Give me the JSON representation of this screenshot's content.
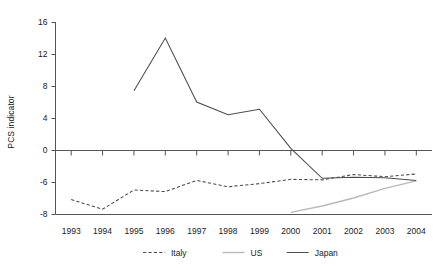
{
  "chart_data": {
    "type": "line",
    "title": "",
    "subtitle": "",
    "xlabel": "",
    "ylabel": "PCS indicator",
    "x": [
      1993,
      1994,
      1995,
      1996,
      1997,
      1998,
      1999,
      2000,
      2001,
      2002,
      2003,
      2004
    ],
    "xtick_labels": [
      "1993",
      "1994",
      "1995",
      "1996",
      "1997",
      "1998",
      "1999",
      "2000",
      "2001",
      "2002",
      "2003",
      "2004"
    ],
    "ytick_labels": [
      "16",
      "12",
      "8",
      "4",
      "0",
      "-6",
      "-8"
    ],
    "ytick_values": [
      16,
      12,
      8,
      4,
      0,
      -6,
      -8
    ],
    "ylim": [
      -8,
      16
    ],
    "grid": false,
    "legend_position": "bottom",
    "zero_line": true,
    "series": [
      {
        "name": "Italy",
        "style": "dashed",
        "color": "#4a4a4a",
        "x": [
          1993,
          1994,
          1995,
          1996,
          1997,
          1998,
          1999,
          2000,
          2001,
          2002,
          2003,
          2004
        ],
        "values": [
          -7.1,
          -7.7,
          -6.5,
          -6.6,
          -5.7,
          -6.3,
          -6.1,
          -5.5,
          -5.6,
          -4.6,
          -5.0,
          -4.5
        ]
      },
      {
        "name": "US",
        "style": "solid",
        "color": "#b9b9b9",
        "x": [
          2000,
          2001,
          2002,
          2003,
          2004
        ],
        "values": [
          -7.9,
          -7.5,
          -7.0,
          -6.4,
          -5.8
        ]
      },
      {
        "name": "Japan",
        "style": "solid",
        "color": "#4a4a4a",
        "x": [
          1995,
          1996,
          1997,
          1998,
          1999,
          2000,
          2001,
          2002,
          2003,
          2004
        ],
        "values": [
          7.4,
          14.0,
          6.0,
          4.4,
          5.1,
          0.2,
          -5.3,
          -5.1,
          -5.2,
          -5.7
        ]
      }
    ],
    "legend": [
      {
        "label": "Italy",
        "style": "dashed",
        "color": "#4a4a4a"
      },
      {
        "label": "US",
        "style": "solid",
        "color": "#b9b9b9"
      },
      {
        "label": "Japan",
        "style": "solid",
        "color": "#4a4a4a"
      }
    ]
  }
}
